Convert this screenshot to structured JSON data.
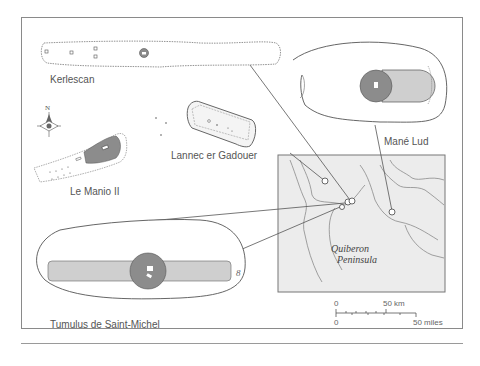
{
  "figure": {
    "sites": [
      {
        "id": "kerlescan",
        "label": "Kerlescan"
      },
      {
        "id": "mane-lud",
        "label": "Mané Lud"
      },
      {
        "id": "lannec-er-gadouer",
        "label": "Lannec er Gadouer"
      },
      {
        "id": "le-manio-ii",
        "label": "Le Manio II"
      },
      {
        "id": "tumulus-saint-michel",
        "label": "Tumulus de Saint-Michel"
      }
    ],
    "map": {
      "place_label_line1": "Quiberon",
      "place_label_line2": "Peninsula"
    },
    "compass": {
      "north_label": "N"
    },
    "scale": {
      "km_start": "0",
      "km_end": "50 km",
      "miles_start": "0",
      "miles_end": "50 miles"
    },
    "colors": {
      "dark_fill": "#8c8c8c",
      "light_fill": "#cfcfcf",
      "outline": "#555555",
      "map_bg": "#ececec"
    }
  }
}
